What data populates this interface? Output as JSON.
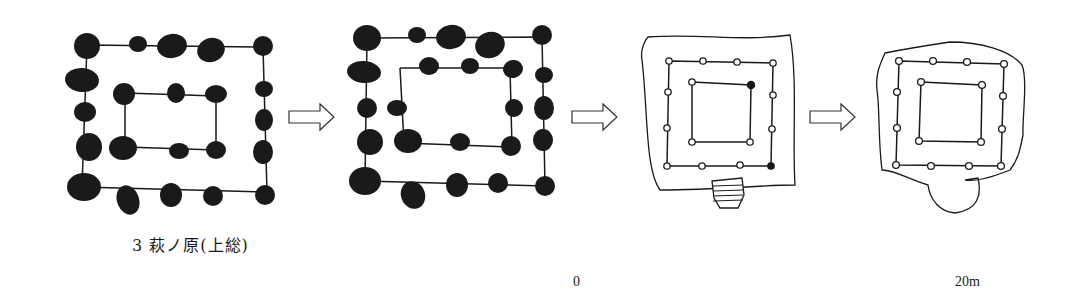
{
  "figure": {
    "caption": "3 萩ノ原(上総)",
    "scale": {
      "start_label": "0",
      "end_label": "20m"
    },
    "stages": [
      {
        "id": "stage-1",
        "style": "filled-post-holes",
        "outer_ring": "4x4 posts",
        "inner_ring": "3x3 posts"
      },
      {
        "id": "stage-2",
        "style": "filled-post-holes",
        "outer_ring": "4x4 posts",
        "inner_ring": "4x3 posts"
      },
      {
        "id": "stage-3",
        "style": "open-post-holes-with-platform",
        "outer_ring": "4x4 posts",
        "inner_ring": "2x2 posts",
        "attachment": "hatched-step"
      },
      {
        "id": "stage-4",
        "style": "open-post-holes-with-platform",
        "outer_ring": "4x4 posts",
        "inner_ring": "2x2 posts",
        "attachment": "rounded-lobe"
      }
    ],
    "arrows": [
      "stage-1-to-2",
      "stage-2-to-3",
      "stage-3-to-4"
    ],
    "colors": {
      "ink": "#1a1a1a",
      "paper": "#ffffff"
    }
  }
}
